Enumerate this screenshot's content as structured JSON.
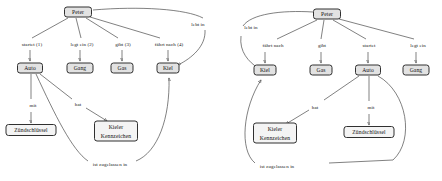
{
  "figure": {
    "kind": "semantic-network-pair"
  },
  "colors": {
    "node_fill": "#e2e2e2",
    "node_fill_plain": "#f4f4f4",
    "node_border": "#303030",
    "edge": "#4a4a4a",
    "text": "#101010",
    "background": "#ffffff"
  },
  "diagrams": [
    {
      "id": "left",
      "nodes": [
        {
          "id": "peter",
          "label": "Peter",
          "x": 78,
          "y": 12,
          "w": 28,
          "h": 11,
          "style": "filled"
        },
        {
          "id": "auto",
          "label": "Auto",
          "x": 30,
          "y": 68,
          "w": 26,
          "h": 11,
          "style": "filled"
        },
        {
          "id": "gang",
          "label": "Gang",
          "x": 80,
          "y": 68,
          "w": 27,
          "h": 11,
          "style": "filled"
        },
        {
          "id": "gas",
          "label": "Gas",
          "x": 122,
          "y": 68,
          "w": 23,
          "h": 11,
          "style": "filled"
        },
        {
          "id": "kiel",
          "label": "Kiel",
          "x": 168,
          "y": 68,
          "w": 23,
          "h": 11,
          "style": "filled"
        },
        {
          "id": "zuend",
          "label": "Zündschlüssel",
          "x": 31,
          "y": 130,
          "w": 51,
          "h": 12,
          "style": "plain"
        },
        {
          "id": "kennz",
          "label": "Kieler Kennzeichen",
          "x": 116,
          "y": 131,
          "w": 44,
          "h": 21,
          "style": "plain",
          "multiline": true
        }
      ],
      "edge_labels": [
        {
          "id": "startet",
          "text": "startet (1)",
          "x": 32,
          "y": 44
        },
        {
          "id": "legt_ein",
          "text": "legt ein (2)",
          "x": 82,
          "y": 44
        },
        {
          "id": "gibt",
          "text": "gibt (3)",
          "x": 123,
          "y": 44
        },
        {
          "id": "faehrt",
          "text": "fährt nach (4)",
          "x": 169,
          "y": 44
        },
        {
          "id": "lebt_in",
          "text": "lebt in",
          "x": 198,
          "y": 24
        },
        {
          "id": "mit",
          "text": "mit",
          "x": 33,
          "y": 105
        },
        {
          "id": "hat",
          "text": "hat",
          "x": 78,
          "y": 104
        },
        {
          "id": "zugelassen",
          "text": "ist zugelassen in",
          "x": 110,
          "y": 165,
          "two_line": true
        }
      ],
      "edges": [
        {
          "from": "peter",
          "to": "auto",
          "label": "startet (1)"
        },
        {
          "from": "peter",
          "to": "gang",
          "label": "legt ein (2)"
        },
        {
          "from": "peter",
          "to": "gas",
          "label": "gibt (3)"
        },
        {
          "from": "peter",
          "to": "kiel",
          "label": "fährt nach (4)"
        },
        {
          "from": "peter",
          "to": "kiel",
          "label": "lebt in"
        },
        {
          "from": "auto",
          "to": "zuend",
          "label": "mit"
        },
        {
          "from": "auto",
          "to": "kennz",
          "label": "hat"
        },
        {
          "from": "auto",
          "to": "kiel",
          "label": "ist zugelassen in"
        }
      ]
    },
    {
      "id": "right",
      "nodes": [
        {
          "id": "peter",
          "label": "Peter",
          "x": 106,
          "y": 14,
          "w": 28,
          "h": 11,
          "style": "filled"
        },
        {
          "id": "kiel",
          "label": "Kiel",
          "x": 44,
          "y": 70,
          "w": 23,
          "h": 11,
          "style": "filled"
        },
        {
          "id": "gas",
          "label": "Gas",
          "x": 100,
          "y": 70,
          "w": 23,
          "h": 11,
          "style": "filled"
        },
        {
          "id": "auto",
          "label": "Auto",
          "x": 147,
          "y": 70,
          "w": 26,
          "h": 11,
          "style": "filled"
        },
        {
          "id": "gang",
          "label": "Gang",
          "x": 195,
          "y": 70,
          "w": 27,
          "h": 11,
          "style": "filled"
        },
        {
          "id": "kennz",
          "label": "Kieler Kennzeichen",
          "x": 54,
          "y": 133,
          "w": 44,
          "h": 21,
          "style": "plain",
          "multiline": true
        },
        {
          "id": "zuend",
          "label": "Zündschlüssel",
          "x": 148,
          "y": 132,
          "w": 51,
          "h": 12,
          "style": "plain"
        }
      ],
      "edge_labels": [
        {
          "id": "lebt_in",
          "text": "lebt in",
          "x": 30,
          "y": 27
        },
        {
          "id": "faehrt",
          "text": "fährt nach",
          "x": 52,
          "y": 45
        },
        {
          "id": "gibt",
          "text": "gibt",
          "x": 101,
          "y": 45
        },
        {
          "id": "startet",
          "text": "startet",
          "x": 148,
          "y": 45
        },
        {
          "id": "legt_ein",
          "text": "legt ein",
          "x": 197,
          "y": 45
        },
        {
          "id": "hat",
          "text": "hat",
          "x": 94,
          "y": 107
        },
        {
          "id": "mit",
          "text": "mit",
          "x": 150,
          "y": 107
        },
        {
          "id": "zugelassen",
          "text": "ist zugelassen in",
          "x": 56,
          "y": 167,
          "two_line": true
        }
      ],
      "edges": [
        {
          "from": "peter",
          "to": "kiel",
          "label": "lebt in"
        },
        {
          "from": "peter",
          "to": "kiel",
          "label": "fährt nach"
        },
        {
          "from": "peter",
          "to": "gas",
          "label": "gibt"
        },
        {
          "from": "peter",
          "to": "auto",
          "label": "startet"
        },
        {
          "from": "peter",
          "to": "gang",
          "label": "legt ein"
        },
        {
          "from": "auto",
          "to": "kennz",
          "label": "hat"
        },
        {
          "from": "auto",
          "to": "zuend",
          "label": "mit"
        },
        {
          "from": "auto",
          "to": "kiel",
          "label": "ist zugelassen in"
        }
      ]
    }
  ]
}
